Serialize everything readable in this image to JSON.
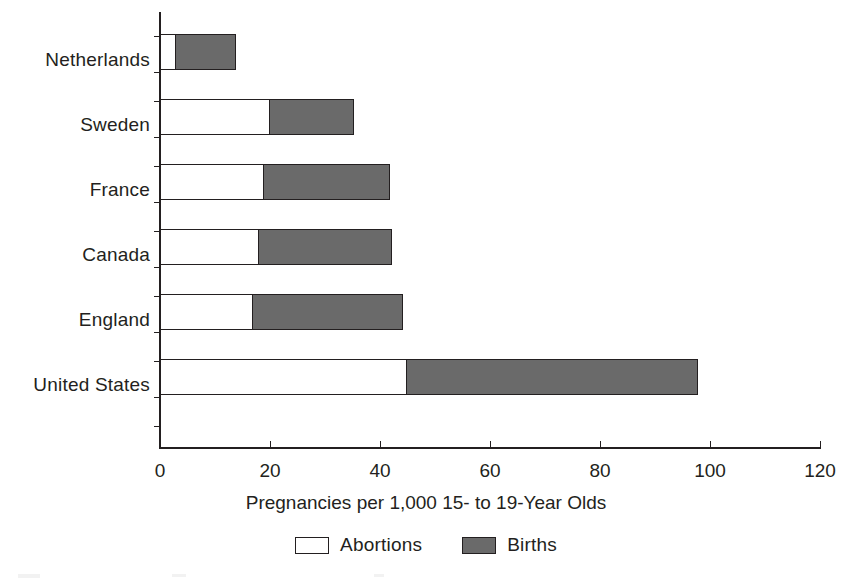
{
  "chart_data": {
    "type": "bar",
    "orientation": "horizontal",
    "stacked": true,
    "title": "",
    "xlabel": "Pregnancies per 1,000 15- to 19-Year Olds",
    "ylabel": "",
    "xlim": [
      0,
      120
    ],
    "xticks": [
      0,
      20,
      40,
      60,
      80,
      100,
      120
    ],
    "xtick_labels": [
      "0",
      "20",
      "40",
      "60",
      "80",
      "100",
      "120"
    ],
    "grid": false,
    "legend_position": "bottom-center",
    "categories": [
      "Netherlands",
      "Sweden",
      "France",
      "Canada",
      "England",
      "United States"
    ],
    "series": [
      {
        "name": "Abortions",
        "color": "#ffffff",
        "values": [
          3,
          20,
          19,
          18,
          17,
          45
        ]
      },
      {
        "name": "Births",
        "color": "#6a6a6a",
        "values": [
          11,
          15.5,
          23,
          24.5,
          27.5,
          53
        ]
      }
    ],
    "totals": [
      14,
      35.5,
      42,
      42.5,
      44.5,
      98
    ]
  },
  "axis": {
    "x_title": "Pregnancies per 1,000 15- to 19-Year Olds",
    "tick_labels": [
      "0",
      "20",
      "40",
      "60",
      "80",
      "100",
      "120"
    ]
  },
  "categories": [
    {
      "label": "Netherlands"
    },
    {
      "label": "Sweden"
    },
    {
      "label": "France"
    },
    {
      "label": "Canada"
    },
    {
      "label": "England"
    },
    {
      "label": "United States"
    }
  ],
  "legend": {
    "items": [
      {
        "label": "Abortions",
        "color": "#ffffff",
        "swatch": "open-square-swatch"
      },
      {
        "label": "Births",
        "color": "#6a6a6a",
        "swatch": "filled-square-swatch"
      }
    ]
  },
  "colors": {
    "ink": "#231f20",
    "births_gray": "#6a6a6a",
    "abortions_white": "#ffffff",
    "background": "#ffffff"
  }
}
